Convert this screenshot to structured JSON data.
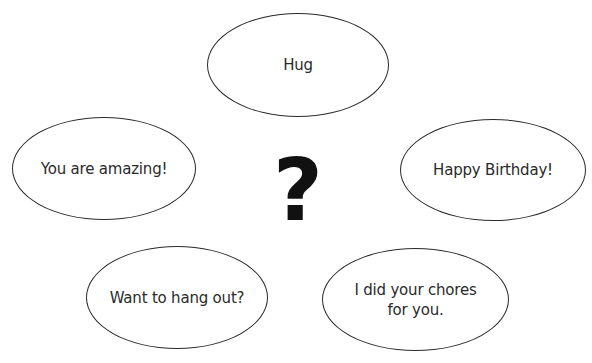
{
  "center": {
    "symbol": "?"
  },
  "bubbles": [
    {
      "label": "Hug"
    },
    {
      "label": "You are amazing!"
    },
    {
      "label": "Happy Birthday!"
    },
    {
      "label": "Want to hang out?"
    },
    {
      "label": "I did your chores\nfor you."
    }
  ],
  "colors": {
    "outline": "#2b2b2b",
    "text": "#2a2a2a",
    "background": "#ffffff"
  }
}
